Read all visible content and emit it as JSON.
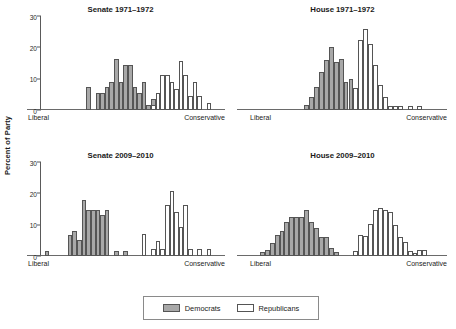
{
  "figure": {
    "ylabel": "Percent of Party",
    "axis_left_label": "Liberal",
    "axis_right_label": "Conservative"
  },
  "legend": {
    "items": [
      {
        "name": "democrats",
        "label": "Democrats",
        "color": "#a8a8a8"
      },
      {
        "name": "republicans",
        "label": "Republicans",
        "color": "#ffffff"
      }
    ]
  },
  "chart_data": [
    {
      "type": "bar",
      "title": "Senate 1971–1972",
      "xlabel": "",
      "ylabel": "Percent of Party",
      "xlim": [
        0,
        40
      ],
      "ylim": [
        0,
        30
      ],
      "yticks": [
        0,
        10,
        20,
        30
      ],
      "xtick_labels": [
        "Liberal",
        "Conservative"
      ],
      "grid": false,
      "legend_position": "bottom",
      "series": [
        {
          "name": "Democrats",
          "color": "#a8a8a8",
          "bins": [
            10,
            11,
            12,
            13,
            14,
            15,
            16,
            17,
            18,
            19,
            20,
            21,
            22,
            23,
            24,
            25
          ],
          "values": [
            7.2,
            0,
            5.3,
            5.4,
            7.4,
            8.9,
            16.2,
            9.1,
            14.4,
            14.5,
            7.3,
            5.5,
            8.9,
            1.7,
            3.6,
            3.7
          ]
        },
        {
          "name": "Republicans",
          "color": "#ffffff",
          "bins": [
            24,
            25,
            26,
            27,
            28,
            29,
            30,
            31,
            32,
            33,
            34,
            35,
            36,
            37
          ],
          "values": [
            1.7,
            5.3,
            11.2,
            11.2,
            8.9,
            6.7,
            15.8,
            11.2,
            4.4,
            8.9,
            4.4,
            0,
            2.1,
            0
          ]
        }
      ]
    },
    {
      "type": "bar",
      "title": "House 1971–1972",
      "xlabel": "",
      "ylabel": "",
      "xlim": [
        0,
        40
      ],
      "ylim": [
        0,
        30
      ],
      "yticks": [
        0,
        10,
        20,
        30
      ],
      "xtick_labels": [
        "Liberal",
        "Conservative"
      ],
      "grid": false,
      "legend_position": "bottom",
      "series": [
        {
          "name": "Democrats",
          "color": "#a8a8a8",
          "bins": [
            11,
            12,
            13,
            14,
            15,
            16,
            17,
            18,
            19,
            20,
            21,
            22
          ],
          "values": [
            1.6,
            4.0,
            7.5,
            12.0,
            16.0,
            20.0,
            15.2,
            16.2,
            9.0,
            10.0,
            6.2,
            4.2
          ]
        },
        {
          "name": "Republicans",
          "color": "#ffffff",
          "bins": [
            21,
            22,
            23,
            24,
            25,
            26,
            27,
            28,
            29,
            30,
            31,
            32,
            33,
            34,
            35,
            36
          ],
          "values": [
            7.0,
            22.2,
            26.0,
            21.2,
            14.5,
            8.0,
            4.2,
            1.2,
            1.4,
            1.4,
            0,
            1.4,
            0,
            1.4,
            0,
            0
          ]
        }
      ]
    },
    {
      "type": "bar",
      "title": "Senate 2009–2010",
      "xlabel": "",
      "ylabel": "Percent of Party",
      "xlim": [
        0,
        40
      ],
      "ylim": [
        0,
        30
      ],
      "yticks": [
        0,
        10,
        20,
        30
      ],
      "xtick_labels": [
        "Liberal",
        "Conservative"
      ],
      "grid": false,
      "legend_position": "bottom",
      "series": [
        {
          "name": "Democrats",
          "color": "#a8a8a8",
          "bins": [
            1,
            2,
            3,
            4,
            5,
            6,
            7,
            8,
            9,
            10,
            11,
            12,
            13,
            14,
            15,
            16,
            17,
            18,
            19,
            20
          ],
          "values": [
            1.6,
            0,
            0,
            0,
            0,
            6.6,
            8.1,
            5.0,
            18.0,
            14.8,
            14.8,
            14.8,
            13.0,
            14.8,
            0,
            1.5,
            0,
            1.5,
            0,
            0
          ],
          "note": "Leftmost isolated bar at far-left of axis"
        },
        {
          "name": "Republicans",
          "color": "#ffffff",
          "bins": [
            22,
            23,
            24,
            25,
            26,
            27,
            28,
            29,
            30,
            31,
            32,
            33,
            34,
            35,
            36,
            37
          ],
          "values": [
            7.0,
            0,
            2.2,
            4.7,
            2.2,
            16.2,
            20.8,
            14.0,
            9.3,
            16.2,
            2.2,
            0,
            2.2,
            0,
            2.2,
            0
          ]
        }
      ]
    },
    {
      "type": "bar",
      "title": "House 2009–2010",
      "xlabel": "",
      "ylabel": "",
      "xlim": [
        0,
        40
      ],
      "ylim": [
        0,
        30
      ],
      "yticks": [
        0,
        10,
        20,
        30
      ],
      "xtick_labels": [
        "Liberal",
        "Conservative"
      ],
      "grid": false,
      "legend_position": "bottom",
      "series": [
        {
          "name": "Democrats",
          "color": "#a8a8a8",
          "bins": [
            2,
            3,
            4,
            5,
            6,
            7,
            8,
            9,
            10,
            11,
            12,
            13,
            14,
            15,
            16,
            17
          ],
          "values": [
            1.4,
            2.0,
            4.2,
            6.8,
            8.0,
            11.0,
            12.4,
            12.4,
            12.6,
            14.8,
            11.0,
            8.8,
            6.0,
            6.2,
            2.4,
            1.4
          ]
        },
        {
          "name": "Republicans",
          "color": "#ffffff",
          "bins": [
            21,
            22,
            23,
            24,
            25,
            26,
            27,
            28,
            29,
            30,
            31,
            32,
            33,
            34,
            35
          ],
          "values": [
            1.6,
            6.8,
            6.4,
            10.2,
            14.6,
            15.2,
            14.6,
            14.0,
            10.0,
            6.2,
            4.4,
            1.6,
            1.0,
            2.0,
            2.0
          ]
        }
      ]
    }
  ]
}
